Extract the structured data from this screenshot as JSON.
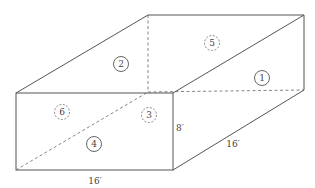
{
  "diagram": {
    "title": "",
    "type": "rectangular box with numbered faces",
    "colors": {
      "line": "#555555",
      "hidden_line": "#777777",
      "text": "#444444",
      "background": "#ffffff"
    },
    "faces": [
      {
        "id": 1,
        "label": "1",
        "visible": true,
        "style": "solid"
      },
      {
        "id": 2,
        "label": "2",
        "visible": true,
        "style": "solid"
      },
      {
        "id": 3,
        "label": "3",
        "visible": false,
        "style": "dashed"
      },
      {
        "id": 4,
        "label": "4",
        "visible": true,
        "style": "solid"
      },
      {
        "id": 5,
        "label": "5",
        "visible": false,
        "style": "dashed"
      },
      {
        "id": 6,
        "label": "6",
        "visible": false,
        "style": "dashed"
      }
    ],
    "dimensions": {
      "height": "8′",
      "depth": "16′",
      "width": "16′"
    }
  }
}
